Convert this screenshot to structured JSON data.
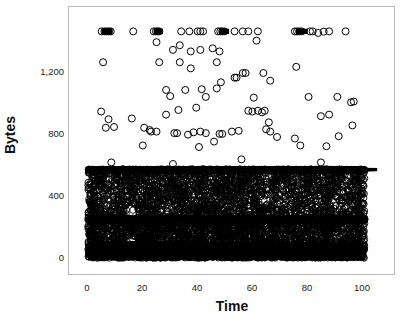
{
  "chart_data": {
    "type": "scatter",
    "title": "",
    "xlabel": "Time",
    "ylabel": "Bytes",
    "xlim": [
      -7,
      112
    ],
    "ylim": [
      -80,
      1560
    ],
    "xticks": [
      0,
      20,
      40,
      60,
      80,
      100
    ],
    "xtick_labels": [
      "0",
      "20",
      "40",
      "60",
      "80",
      "100"
    ],
    "yticks": [
      0,
      400,
      800,
      1200
    ],
    "ytick_labels": [
      "0",
      "400",
      "800",
      "1,200"
    ],
    "grid": false,
    "legend": null,
    "marker": "open-circle",
    "marker_color": "#000000",
    "marker_size": 3.2,
    "frame_color": "#b9b9b9",
    "background": "#ffffff",
    "bands": [
      {
        "name": "top-dense-line",
        "value": 570,
        "density": "very-high"
      },
      {
        "name": "mid-dense-line",
        "value": 250,
        "density": "very-high"
      },
      {
        "name": "bottom-saturated-block",
        "value_range": [
          0,
          90
        ],
        "density": "saturated"
      },
      {
        "name": "upper-fill",
        "value_range": [
          255,
          565
        ],
        "density": "high"
      },
      {
        "name": "lower-fill",
        "value_range": [
          95,
          245
        ],
        "density": "high"
      },
      {
        "name": "sparse-outliers",
        "value_range": [
          600,
          1480
        ],
        "density": "low"
      },
      {
        "name": "max-row",
        "value": 1470,
        "density": "low"
      }
    ],
    "n_points_approx": 9000,
    "series": [
      {
        "name": "bytes",
        "x_range": [
          0,
          101
        ],
        "y_range": [
          0,
          1470
        ]
      }
    ],
    "outlier_points": [
      {
        "x": 5.0,
        "y": 1470
      },
      {
        "x": 6.0,
        "y": 1470
      },
      {
        "x": 6.8,
        "y": 1470
      },
      {
        "x": 7.6,
        "y": 1470
      },
      {
        "x": 8.3,
        "y": 1470
      },
      {
        "x": 16.5,
        "y": 1470
      },
      {
        "x": 24.0,
        "y": 1470
      },
      {
        "x": 24.8,
        "y": 1470
      },
      {
        "x": 25.4,
        "y": 1470
      },
      {
        "x": 26.0,
        "y": 1470
      },
      {
        "x": 34.0,
        "y": 1470
      },
      {
        "x": 37.0,
        "y": 1470
      },
      {
        "x": 40.0,
        "y": 1470
      },
      {
        "x": 41.0,
        "y": 1470
      },
      {
        "x": 42.0,
        "y": 1470
      },
      {
        "x": 47.5,
        "y": 1470
      },
      {
        "x": 48.3,
        "y": 1470
      },
      {
        "x": 49.0,
        "y": 1470
      },
      {
        "x": 49.8,
        "y": 1470
      },
      {
        "x": 53.5,
        "y": 1470
      },
      {
        "x": 56.5,
        "y": 1470
      },
      {
        "x": 58.5,
        "y": 1470
      },
      {
        "x": 62.0,
        "y": 1470
      },
      {
        "x": 75.5,
        "y": 1470
      },
      {
        "x": 76.3,
        "y": 1470
      },
      {
        "x": 77.1,
        "y": 1470
      },
      {
        "x": 78.0,
        "y": 1470
      },
      {
        "x": 81.0,
        "y": 1470
      },
      {
        "x": 82.0,
        "y": 1470
      },
      {
        "x": 84.0,
        "y": 1460
      },
      {
        "x": 86.0,
        "y": 1468
      },
      {
        "x": 88.0,
        "y": 1470
      },
      {
        "x": 94.0,
        "y": 1470
      },
      {
        "x": 25.0,
        "y": 1400
      },
      {
        "x": 31.0,
        "y": 1350
      },
      {
        "x": 33.5,
        "y": 1380
      },
      {
        "x": 37.5,
        "y": 1340
      },
      {
        "x": 41.0,
        "y": 1350
      },
      {
        "x": 45.5,
        "y": 1360
      },
      {
        "x": 48.0,
        "y": 1340
      },
      {
        "x": 61.5,
        "y": 1410
      },
      {
        "x": 5.5,
        "y": 1270
      },
      {
        "x": 26.0,
        "y": 1270
      },
      {
        "x": 33.5,
        "y": 1270
      },
      {
        "x": 37.5,
        "y": 1230
      },
      {
        "x": 47.0,
        "y": 1270
      },
      {
        "x": 56.5,
        "y": 1200
      },
      {
        "x": 57.5,
        "y": 1200
      },
      {
        "x": 76.0,
        "y": 1240
      },
      {
        "x": 53.5,
        "y": 1170
      },
      {
        "x": 54.2,
        "y": 1170
      },
      {
        "x": 66.5,
        "y": 1150
      },
      {
        "x": 64.0,
        "y": 1200
      },
      {
        "x": 48.5,
        "y": 1140
      },
      {
        "x": 28.5,
        "y": 1090
      },
      {
        "x": 35.5,
        "y": 1090
      },
      {
        "x": 41.5,
        "y": 1095
      },
      {
        "x": 47.0,
        "y": 1100
      },
      {
        "x": 43.0,
        "y": 1045
      },
      {
        "x": 30.0,
        "y": 1050
      },
      {
        "x": 60.5,
        "y": 1040
      },
      {
        "x": 80.5,
        "y": 1045
      },
      {
        "x": 91.0,
        "y": 1045
      },
      {
        "x": 96.0,
        "y": 1010
      },
      {
        "x": 97.0,
        "y": 1015
      },
      {
        "x": 4.8,
        "y": 950
      },
      {
        "x": 7.5,
        "y": 900
      },
      {
        "x": 16.0,
        "y": 905
      },
      {
        "x": 33.0,
        "y": 960
      },
      {
        "x": 39.5,
        "y": 975
      },
      {
        "x": 28.5,
        "y": 930
      },
      {
        "x": 58.5,
        "y": 955
      },
      {
        "x": 60.0,
        "y": 950
      },
      {
        "x": 62.0,
        "y": 955
      },
      {
        "x": 63.5,
        "y": 945
      },
      {
        "x": 64.5,
        "y": 955
      },
      {
        "x": 85.0,
        "y": 920
      },
      {
        "x": 88.0,
        "y": 930
      },
      {
        "x": 66.0,
        "y": 880
      },
      {
        "x": 6.5,
        "y": 845
      },
      {
        "x": 9.5,
        "y": 850
      },
      {
        "x": 20.5,
        "y": 845
      },
      {
        "x": 22.5,
        "y": 830
      },
      {
        "x": 23.0,
        "y": 820
      },
      {
        "x": 25.0,
        "y": 820
      },
      {
        "x": 31.5,
        "y": 810
      },
      {
        "x": 32.5,
        "y": 810
      },
      {
        "x": 36.5,
        "y": 800
      },
      {
        "x": 38.5,
        "y": 815
      },
      {
        "x": 41.0,
        "y": 820
      },
      {
        "x": 43.0,
        "y": 810
      },
      {
        "x": 48.0,
        "y": 805
      },
      {
        "x": 49.0,
        "y": 805
      },
      {
        "x": 55.0,
        "y": 825
      },
      {
        "x": 52.5,
        "y": 820
      },
      {
        "x": 65.0,
        "y": 835
      },
      {
        "x": 66.5,
        "y": 820
      },
      {
        "x": 96.5,
        "y": 860
      },
      {
        "x": 91.5,
        "y": 790
      },
      {
        "x": 75.5,
        "y": 775
      },
      {
        "x": 46.0,
        "y": 755
      },
      {
        "x": 69.0,
        "y": 785
      },
      {
        "x": 20.0,
        "y": 730
      },
      {
        "x": 40.5,
        "y": 720
      },
      {
        "x": 77.5,
        "y": 730
      },
      {
        "x": 87.0,
        "y": 725
      },
      {
        "x": 8.5,
        "y": 620
      },
      {
        "x": 56.0,
        "y": 640
      },
      {
        "x": 85.0,
        "y": 620
      },
      {
        "x": 31.0,
        "y": 610
      }
    ]
  },
  "axes": {
    "ylabel": "Bytes",
    "xlabel": "Time",
    "ytick_labels": [
      "1,200",
      "800",
      "400",
      "0"
    ],
    "xtick_labels": [
      "0",
      "20",
      "40",
      "60",
      "80",
      "100"
    ]
  }
}
